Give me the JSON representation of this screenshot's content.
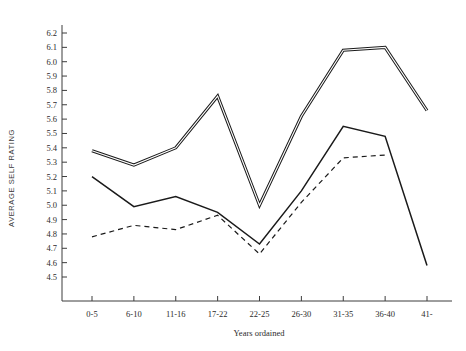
{
  "chart_data": {
    "type": "line",
    "title": "",
    "xlabel": "Years ordained",
    "ylabel": "AVERAGE SELF RATING",
    "categories": [
      "0-5",
      "6-10",
      "11-16",
      "17-22",
      "22-25",
      "26-30",
      "31-35",
      "36-40",
      "41-"
    ],
    "ylim": [
      4.5,
      6.2
    ],
    "xlim": [
      0,
      8
    ],
    "ytick_labels": [
      "6.2",
      "6.1",
      "6.0",
      "5.9",
      "5.8",
      "5.7",
      "5.6",
      "5.5",
      "5.4",
      "5.3",
      "5.2",
      "5.1",
      "5.0",
      "4.9",
      "4.8",
      "4.7",
      "4.6",
      "4.5"
    ],
    "ytick_values": [
      6.2,
      6.1,
      6.0,
      5.9,
      5.8,
      5.7,
      5.6,
      5.5,
      5.4,
      5.3,
      5.2,
      5.1,
      5.0,
      4.9,
      4.8,
      4.7,
      4.6,
      4.5
    ],
    "grid": false,
    "legend": "none",
    "series": [
      {
        "name": "series-double-line",
        "style": "double",
        "values": [
          5.38,
          5.28,
          5.4,
          5.76,
          5.0,
          5.62,
          6.08,
          6.1,
          5.66
        ]
      },
      {
        "name": "series-solid-line",
        "style": "solid",
        "values": [
          5.2,
          4.99,
          5.06,
          4.95,
          4.73,
          5.1,
          5.55,
          5.48,
          4.58
        ]
      },
      {
        "name": "series-dashed-line",
        "style": "dashed",
        "values": [
          4.78,
          4.86,
          4.83,
          4.93,
          4.66,
          5.02,
          5.33,
          5.35,
          null
        ]
      }
    ]
  }
}
